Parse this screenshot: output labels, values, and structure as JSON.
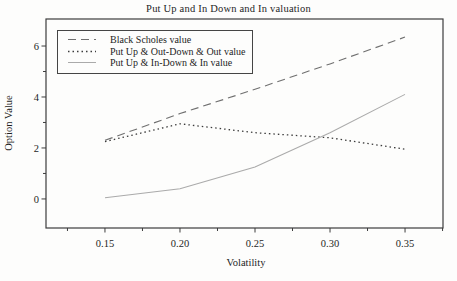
{
  "chart_data": {
    "type": "line",
    "title": "Put Up and In Down and In valuation",
    "xlabel": "Volatility",
    "ylabel": "Option Value",
    "x": [
      0.15,
      0.2,
      0.25,
      0.3,
      0.35
    ],
    "series": [
      {
        "name": "Black Scholes value",
        "line_style": "long-dash",
        "color": "#6f6f6f",
        "values": [
          2.3,
          3.35,
          4.3,
          5.3,
          6.35
        ]
      },
      {
        "name": "Put Up & Out-Down & Out value",
        "line_style": "dotted",
        "color": "#3c3c3c",
        "values": [
          2.25,
          2.95,
          2.6,
          2.4,
          1.95
        ]
      },
      {
        "name": "Put Up & In-Down & In value",
        "line_style": "solid",
        "color": "#aaaaaa",
        "values": [
          0.05,
          0.4,
          1.25,
          2.6,
          4.1
        ]
      }
    ],
    "xlim": [
      0.1107,
      0.3753
    ],
    "ylim": [
      -1.14,
      7.06
    ],
    "x_ticks": {
      "major_values": [
        0.15,
        0.2,
        0.25,
        0.3,
        0.35
      ],
      "major_labels": [
        "0.15",
        "0.20",
        "0.25",
        "0.30",
        "0.35"
      ],
      "minor_values": [
        0.125,
        0.175,
        0.225,
        0.275,
        0.325,
        0.375
      ]
    },
    "y_ticks": {
      "major_values": [
        0,
        2,
        4,
        6
      ],
      "major_labels": [
        "0",
        "2",
        "4",
        "6"
      ],
      "minor_values": [
        1,
        3,
        5
      ]
    },
    "legend_position": "top-left",
    "grid": false,
    "frame_color": "#3d3d3d",
    "text_color": "#1e1e1e",
    "background": "#fdfdfc"
  }
}
